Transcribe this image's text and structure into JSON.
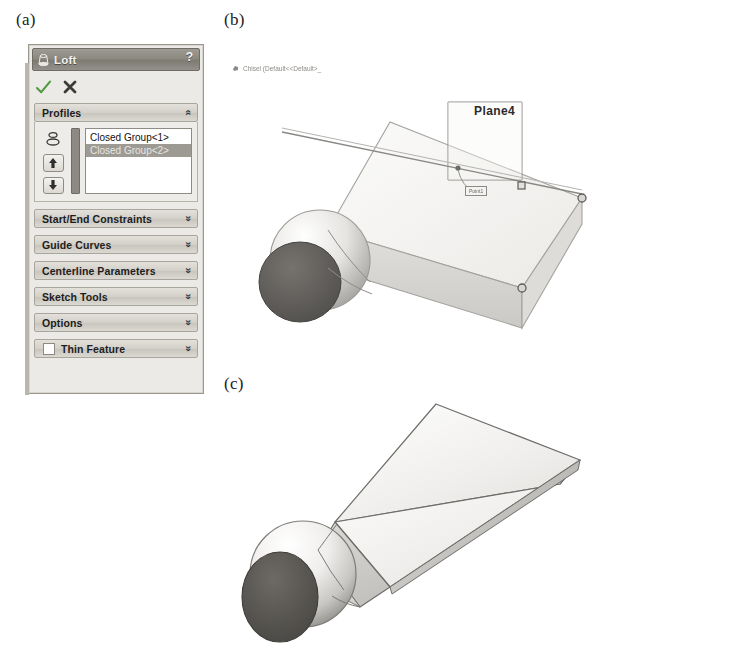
{
  "figure": {
    "panel_a_label": "(a)",
    "panel_b_label": "(b)",
    "panel_c_label": "(c)"
  },
  "loft_dialog": {
    "title": "Loft",
    "title_icon": "loft-icon",
    "help_label": "?",
    "accept_icon": "green-check-icon",
    "cancel_icon": "red-x-icon",
    "profiles": {
      "header": "Profiles",
      "collapse_icon": "chevron-double-up-icon",
      "selector_icon": "loft-profiles-icon",
      "move_up_icon": "arrow-up-icon",
      "move_down_icon": "arrow-down-icon",
      "items": [
        {
          "label": "Closed Group<1>",
          "selected": false
        },
        {
          "label": "Closed Group<2>",
          "selected": true
        }
      ]
    },
    "sections": [
      {
        "label": "Start/End Constraints",
        "expand_icon": "chevron-double-down-icon"
      },
      {
        "label": "Guide Curves",
        "expand_icon": "chevron-double-down-icon"
      },
      {
        "label": "Centerline Parameters",
        "expand_icon": "chevron-double-down-icon"
      },
      {
        "label": "Sketch Tools",
        "expand_icon": "chevron-double-down-icon"
      },
      {
        "label": "Options",
        "expand_icon": "chevron-double-down-icon"
      }
    ],
    "thin_feature": {
      "label": "Thin Feature",
      "checked": false,
      "expand_icon": "chevron-double-down-icon"
    }
  },
  "viewport_b": {
    "tree_label": "Chisel (Default<<Default>_",
    "tree_icon": "part-icon",
    "plane_label": "Plane4",
    "point_callout": "Point1"
  },
  "viewport_c": {
    "model_name": "chisel-solid-model"
  },
  "colors": {
    "title_bar": "#8c8980",
    "panel_bg": "#eceae6",
    "section_head": "#d3d0c9",
    "selection": "#9d9a94",
    "accept_green": "#4f9a3e",
    "model_face_light": "#f1f0ee",
    "model_face_mid": "#d9d8d5",
    "model_end_dark": "#5b5b5b"
  }
}
